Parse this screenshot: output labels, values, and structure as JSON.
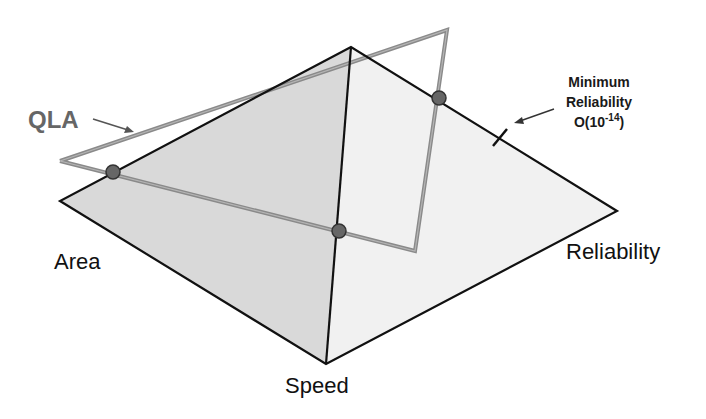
{
  "diagram": {
    "type": "tradeoff-pyramid",
    "axes": {
      "area": "Area",
      "speed": "Speed",
      "reliability": "Reliability"
    },
    "qla": {
      "label": "QLA"
    },
    "annotation": {
      "line1": "Minimum",
      "line2": "Reliability",
      "line3_prefix": "O(10",
      "line3_sup": "-14",
      "line3_suffix": ")"
    },
    "colors": {
      "left_face": "#d9d9d9",
      "right_face": "#f1f1f1",
      "edge": "#111111",
      "qla_stroke": "#8a8a8a",
      "point_fill": "#666666",
      "qla_text": "#666666"
    }
  }
}
